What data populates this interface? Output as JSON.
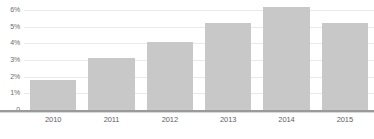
{
  "chart_data": {
    "type": "bar",
    "title": "",
    "subtitle": "",
    "xlabel": "",
    "ylabel": "",
    "categories": [
      "2010",
      "2011",
      "2012",
      "2013",
      "2014",
      "2015"
    ],
    "values": [
      1.8,
      3.1,
      4.1,
      5.2,
      6.2,
      5.2
    ],
    "value_suffix": "%",
    "ylim": [
      0,
      6.6
    ],
    "yticks": [
      0,
      1,
      2,
      3,
      4,
      5,
      6
    ],
    "ytick_labels": [
      "0",
      "1%",
      "2%",
      "3%",
      "4%",
      "5%",
      "6%"
    ],
    "grid": true,
    "legend": false,
    "legend_position": "none",
    "series": [
      {
        "name": "",
        "values": [
          1.8,
          3.1,
          4.1,
          5.2,
          6.2,
          5.2
        ]
      }
    ]
  },
  "style": {
    "bar_color": "#c8c8c8",
    "gridline_color": "#e9e9e9",
    "baseline_color": "#9a9a9a",
    "ytick_color": "#6b6b6b",
    "xtick_color": "#5e5e5e",
    "background": "#ffffff"
  },
  "footer": {
    "note": ""
  }
}
